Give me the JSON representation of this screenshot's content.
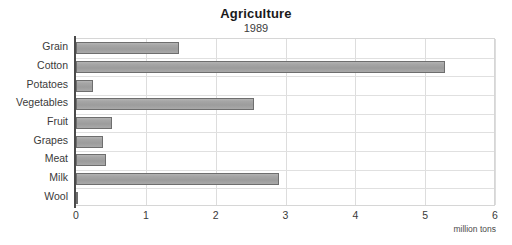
{
  "chart_data": {
    "type": "bar",
    "orientation": "horizontal",
    "title": "Agriculture",
    "subtitle": "1989",
    "xlabel": "million tons",
    "ylabel": "",
    "xlim": [
      0,
      6
    ],
    "xticks": [
      0,
      1,
      2,
      3,
      4,
      5,
      6
    ],
    "xtick_labels": [
      "0",
      "1",
      "2",
      "3",
      "4",
      "5",
      "6"
    ],
    "grid": true,
    "legend": null,
    "categories": [
      "Grain",
      "Cotton",
      "Potatoes",
      "Vegetables",
      "Fruit",
      "Grapes",
      "Meat",
      "Milk",
      "Wool"
    ],
    "values": [
      1.47,
      5.28,
      0.25,
      2.55,
      0.52,
      0.39,
      0.43,
      2.91,
      0.03
    ],
    "series": [
      {
        "name": "1989",
        "values": [
          1.47,
          5.28,
          0.25,
          2.55,
          0.52,
          0.39,
          0.43,
          2.91,
          0.03
        ]
      }
    ],
    "colors": {
      "bar_fill": "#a3a3a3",
      "bar_border": "#6e6e6e",
      "axis": "#4a4a4a",
      "grid": "#dddddd",
      "text": "#3a3a3a",
      "background": "#ffffff"
    }
  }
}
